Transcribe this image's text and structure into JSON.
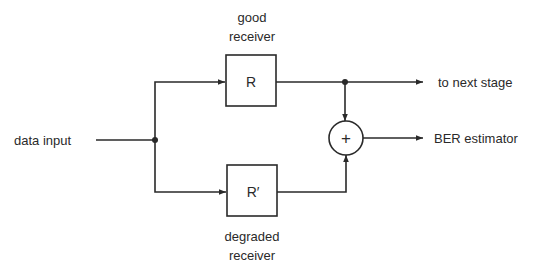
{
  "diagram": {
    "input_label": "data input",
    "good_receiver": {
      "caption_line1": "good",
      "caption_line2": "receiver",
      "symbol": "R"
    },
    "degraded_receiver": {
      "caption_line1": "degraded",
      "caption_line2": "receiver",
      "symbol": "R′"
    },
    "adder_symbol": "+",
    "output_next_stage": "to next stage",
    "output_ber": "BER estimator"
  }
}
